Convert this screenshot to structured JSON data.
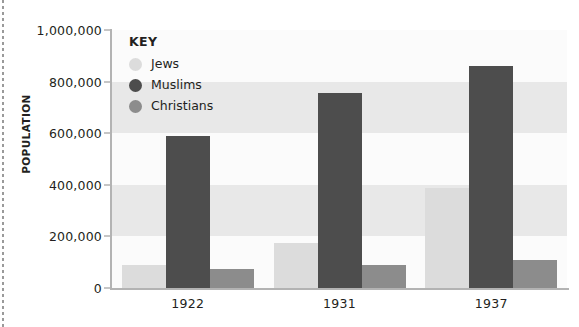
{
  "chart_data": {
    "type": "bar",
    "title": "",
    "xlabel": "",
    "ylabel": "POPULATION",
    "categories": [
      "1922",
      "1931",
      "1937"
    ],
    "ylim": [
      0,
      1000000
    ],
    "ytick_values": [
      0,
      200000,
      400000,
      600000,
      800000,
      1000000
    ],
    "ytick_labels": [
      "0",
      "200,000",
      "400,000",
      "600,000",
      "800,000",
      "1,000,000"
    ],
    "grid": "horizontal-bands",
    "legend_position": "inside-top-left",
    "legend_title": "KEY",
    "series": [
      {
        "name": "Jews",
        "color": "#dcdcdc",
        "values": [
          90000,
          175000,
          386000
        ]
      },
      {
        "name": "Muslims",
        "color": "#4d4d4d",
        "values": [
          590000,
          755000,
          860000
        ]
      },
      {
        "name": "Christians",
        "color": "#8c8c8c",
        "values": [
          73000,
          89000,
          110000
        ]
      }
    ]
  },
  "colors": {
    "plot_background": "#f5f5f5",
    "band_light": "#fbfbfb",
    "band_dark": "#e8e8e8",
    "axis": "#b3b3b3",
    "text": "#231f20"
  }
}
